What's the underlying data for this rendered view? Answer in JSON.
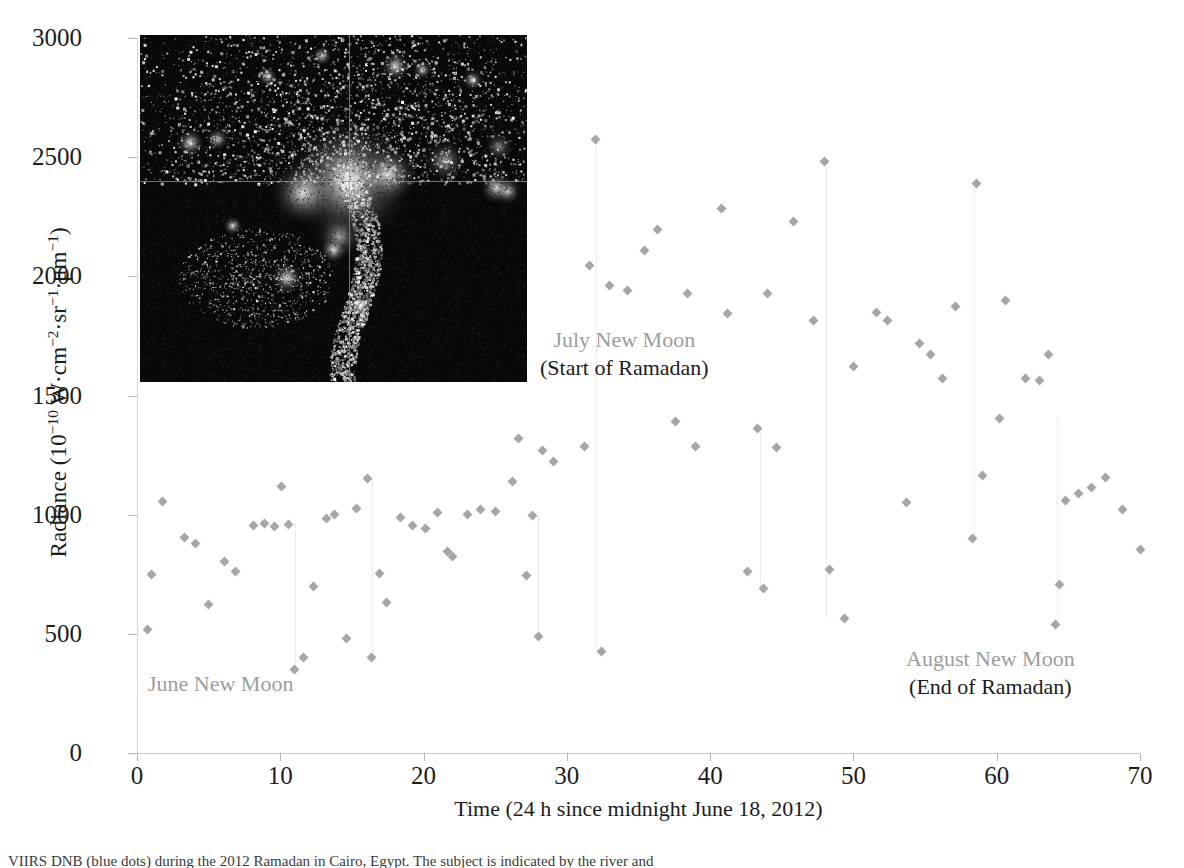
{
  "figure": {
    "background_color": "#ffffff",
    "marker_color": "#a6a6a6",
    "connector_color": "#dadada",
    "annotation_gray": "#9d9d9d",
    "text_color": "#1c1c1c"
  },
  "axes": {
    "y_title_main": "Radiance (10",
    "y_title_exp1": "−10",
    "y_title_mid": " W·cm",
    "y_title_exp2": "−2",
    "y_title_mid2": "·sr",
    "y_title_exp3": "−1",
    "y_title_mid3": "·μm",
    "y_title_exp4": "−1",
    "y_title_end": ")",
    "y_title_full": "Radiance (10⁻¹⁰ W·cm⁻²·sr⁻¹·μm⁻¹)",
    "x_title": "Time (24 h since midnight June 18, 2012)",
    "y_ticks": [
      0,
      500,
      1000,
      1500,
      2000,
      2500,
      3000
    ],
    "x_ticks": [
      0,
      10,
      20,
      30,
      40,
      50,
      60,
      70
    ],
    "ylim": [
      0,
      3000
    ],
    "xlim": [
      0,
      70
    ]
  },
  "annotations": [
    {
      "id": "june",
      "line1": "June New Moon",
      "line2": ""
    },
    {
      "id": "july",
      "line1": "July New Moon",
      "line2": "(Start of Ramadan)"
    },
    {
      "id": "august",
      "line1": "August New Moon",
      "line2": "(End of Ramadan)"
    }
  ],
  "inset": {
    "name": "viirs-dnb-nighttime-lights-inset",
    "description": "Nighttime lights satellite image with crosshair",
    "crosshair_color": "#6e6e6e"
  },
  "caption": {
    "text": "VIIRS DNB (blue dots) during the 2012 Ramadan in Cairo, Egypt. The subject is indicated by the river and"
  },
  "chart_data": {
    "type": "scatter",
    "title": "",
    "xlabel": "Time (24 h since midnight June 18, 2012)",
    "ylabel": "Radiance (10⁻¹⁰ W·cm⁻²·sr⁻¹·μm⁻¹)",
    "xlim": [
      0,
      70
    ],
    "ylim": [
      0,
      3000
    ],
    "grid": false,
    "legend": null,
    "marker": "diamond",
    "series": [
      {
        "name": "Radiance",
        "points": [
          [
            0.7,
            520
          ],
          [
            1.0,
            750
          ],
          [
            1.8,
            1055
          ],
          [
            3.3,
            905
          ],
          [
            4.1,
            880
          ],
          [
            5.0,
            625
          ],
          [
            6.1,
            805
          ],
          [
            6.9,
            760
          ],
          [
            8.1,
            955
          ],
          [
            8.9,
            965
          ],
          [
            9.6,
            950
          ],
          [
            10.1,
            1120
          ],
          [
            10.6,
            960
          ],
          [
            11.0,
            350
          ],
          [
            11.6,
            400
          ],
          [
            12.3,
            700
          ],
          [
            13.2,
            985
          ],
          [
            13.8,
            1000
          ],
          [
            14.6,
            480
          ],
          [
            15.3,
            1025
          ],
          [
            16.1,
            1150
          ],
          [
            16.4,
            400
          ],
          [
            16.9,
            755
          ],
          [
            17.4,
            630
          ],
          [
            18.4,
            990
          ],
          [
            19.2,
            955
          ],
          [
            20.1,
            940
          ],
          [
            21.0,
            1010
          ],
          [
            21.7,
            845
          ],
          [
            22.0,
            825
          ],
          [
            23.1,
            1000
          ],
          [
            24.0,
            1020
          ],
          [
            25.0,
            1015
          ],
          [
            26.2,
            1140
          ],
          [
            26.6,
            1320
          ],
          [
            27.2,
            745
          ],
          [
            27.6,
            995
          ],
          [
            28.0,
            490
          ],
          [
            28.3,
            1270
          ],
          [
            29.1,
            1225
          ],
          [
            31.2,
            1285
          ],
          [
            31.6,
            2045
          ],
          [
            32.0,
            2575
          ],
          [
            32.4,
            425
          ],
          [
            33.0,
            1960
          ],
          [
            34.2,
            1940
          ],
          [
            35.4,
            2110
          ],
          [
            36.3,
            2195
          ],
          [
            37.6,
            1390
          ],
          [
            38.4,
            1930
          ],
          [
            39.0,
            1285
          ],
          [
            40.8,
            2285
          ],
          [
            41.2,
            1845
          ],
          [
            42.6,
            760
          ],
          [
            43.3,
            1360
          ],
          [
            43.7,
            690
          ],
          [
            44.0,
            1930
          ],
          [
            44.6,
            1280
          ],
          [
            45.8,
            2230
          ],
          [
            47.2,
            1815
          ],
          [
            48.0,
            2480
          ],
          [
            48.3,
            770
          ],
          [
            49.4,
            565
          ],
          [
            50.0,
            1620
          ],
          [
            51.6,
            1850
          ],
          [
            52.4,
            1815
          ],
          [
            53.7,
            1050
          ],
          [
            54.6,
            1720
          ],
          [
            55.4,
            1670
          ],
          [
            56.2,
            1570
          ],
          [
            57.1,
            1875
          ],
          [
            58.3,
            900
          ],
          [
            58.6,
            2390
          ],
          [
            59.0,
            1165
          ],
          [
            60.2,
            1405
          ],
          [
            60.6,
            1900
          ],
          [
            62.0,
            1570
          ],
          [
            63.0,
            1565
          ],
          [
            63.6,
            1670
          ],
          [
            64.1,
            540
          ],
          [
            64.4,
            705
          ],
          [
            64.8,
            1060
          ],
          [
            65.7,
            1090
          ],
          [
            66.6,
            1115
          ],
          [
            67.6,
            1155
          ],
          [
            68.8,
            1020
          ],
          [
            70.0,
            855
          ]
        ]
      }
    ],
    "connector_drops": [
      {
        "x": 11.0,
        "y_top": 960,
        "y_bottom": 350
      },
      {
        "x": 16.4,
        "y_top": 1150,
        "y_bottom": 400
      },
      {
        "x": 28.0,
        "y_top": 995,
        "y_bottom": 490
      },
      {
        "x": 32.0,
        "y_top": 2575,
        "y_bottom": 425
      },
      {
        "x": 43.5,
        "y_top": 1360,
        "y_bottom": 690
      },
      {
        "x": 48.1,
        "y_top": 2480,
        "y_bottom": 565
      },
      {
        "x": 58.4,
        "y_top": 2390,
        "y_bottom": 900
      },
      {
        "x": 64.2,
        "y_top": 1405,
        "y_bottom": 540
      }
    ]
  }
}
